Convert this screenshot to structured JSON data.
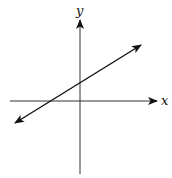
{
  "diagram": {
    "type": "coordinate-plane-line",
    "axes": {
      "x_label": "x",
      "y_label": "y",
      "color": "#222222"
    },
    "line": {
      "description": "Straight line with arrows on both ends, positive slope, positive y-intercept, negative x-intercept",
      "slope_sign": "positive",
      "y_intercept_sign": "positive",
      "x_intercept_sign": "negative",
      "color": "#111111"
    }
  }
}
